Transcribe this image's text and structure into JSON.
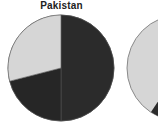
{
  "chart_data": [
    {
      "type": "pie",
      "title": "Pakistan",
      "categories": [
        "Slice A",
        "Slice B",
        "Slice C"
      ],
      "values": [
        50,
        21,
        29
      ],
      "colors": [
        "#2b2b2b",
        "#262626",
        "#d6d6d6"
      ],
      "start_angle": "12 o'clock, clockwise",
      "legend": "none visible"
    },
    {
      "type": "pie",
      "title": "",
      "note": "partially visible (cropped at right edge)",
      "colors": [
        "#d6d6d6",
        "#2b2b2b"
      ]
    }
  ]
}
